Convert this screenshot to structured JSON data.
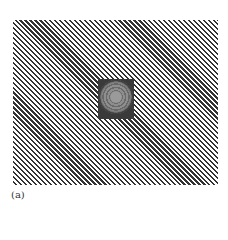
{
  "figure": {
    "label": "(a)",
    "colors": {
      "stripe": "#333333",
      "background": "#ffffff",
      "inset": "#3a3a3a"
    }
  }
}
